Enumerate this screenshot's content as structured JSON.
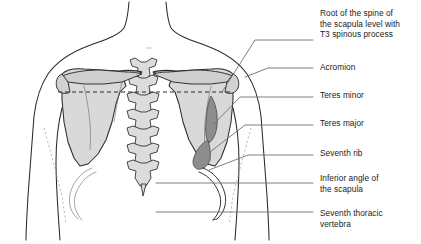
{
  "figure": {
    "background_color": "#ffffff",
    "outline_color": "#2a2a2a",
    "bone_fill_color": "#d9d9d9",
    "muscle_fill_color": "#8d8d8d",
    "leader_line_color": "#6f6f6f",
    "dashed_line_color": "#9a9a9a",
    "text_color": "#1b1b1b"
  },
  "labels": [
    {
      "id": "root-of-spine-of-scapula",
      "text": "Root of the spine of\nthe scapula level with\nT3 spinous process",
      "text_x": 320,
      "text_y": 8,
      "leader": "M 222 92 L 255 40 L 313 40",
      "anchor_x": 222,
      "anchor_y": 92
    },
    {
      "id": "acromion",
      "text": "Acromion",
      "text_x": 320,
      "text_y": 62,
      "leader": "M 245 77 L 268 68 L 313 68",
      "anchor_x": 245,
      "anchor_y": 77
    },
    {
      "id": "teres-minor",
      "text": "Teres minor",
      "text_x": 320,
      "text_y": 90,
      "leader": "M 214 124 L 240 97 L 313 97",
      "anchor_x": 214,
      "anchor_y": 124
    },
    {
      "id": "teres-major",
      "text": "Teres major",
      "text_x": 320,
      "text_y": 118,
      "leader": "M 210 152 L 245 125 L 313 125",
      "anchor_x": 210,
      "anchor_y": 152
    },
    {
      "id": "seventh-rib",
      "text": "Seventh rib",
      "text_x": 320,
      "text_y": 148,
      "leader": "M 209 170 L 248 155 L 313 155",
      "anchor_x": 209,
      "anchor_y": 170
    },
    {
      "id": "inferior-angle-of-scapula",
      "text": "Inferior angle of\nthe scapula",
      "text_x": 320,
      "text_y": 173,
      "leader": "M 156 183 L 313 183",
      "anchor_x": 156,
      "anchor_y": 183
    },
    {
      "id": "seventh-thoracic-vertebra",
      "text": "Seventh thoracic\nvertebra",
      "text_x": 320,
      "text_y": 208,
      "leader": "M 156 212 L 313 212",
      "anchor_x": 156,
      "anchor_y": 212
    }
  ],
  "anatomy": {
    "t3_dashed_line": {
      "id": "t3-level-dashed-line",
      "x1": 58,
      "y1": 92,
      "x2": 232,
      "y2": 92
    },
    "parts": [
      {
        "id": "torso-outline",
        "name": "torso-and-neck-outline"
      },
      {
        "id": "left-scapula",
        "name": "left-scapula"
      },
      {
        "id": "right-scapula",
        "name": "right-scapula"
      },
      {
        "id": "vertebral-column",
        "name": "thoracic-vertebral-column"
      },
      {
        "id": "teres-minor-muscle",
        "name": "teres-minor-muscle"
      },
      {
        "id": "teres-major-muscle",
        "name": "teres-major-muscle"
      },
      {
        "id": "seventh-rib-left",
        "name": "seventh-rib-left"
      },
      {
        "id": "seventh-rib-right",
        "name": "seventh-rib-right"
      }
    ]
  }
}
